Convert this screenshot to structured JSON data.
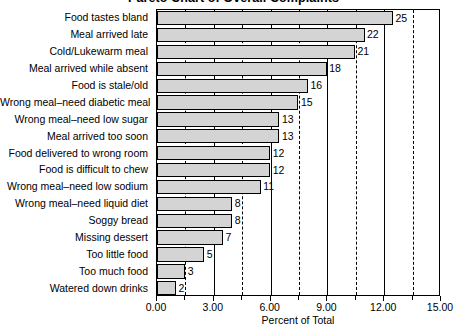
{
  "chart_data": {
    "type": "bar",
    "orientation": "horizontal",
    "title": "Pareto Chart of Overall Complaints",
    "xlabel": "Percent of Total",
    "ylabel": "",
    "xlim": [
      0.0,
      15.0
    ],
    "xticks": [
      "0.00",
      "3.00",
      "6.00",
      "9.00",
      "12.00",
      "15.00"
    ],
    "xtick_values": [
      0.0,
      3.0,
      6.0,
      9.0,
      12.0,
      15.0
    ],
    "minor_gridlines": [
      1.5,
      4.5,
      7.5,
      10.5,
      13.5
    ],
    "grid": true,
    "legend": "none",
    "bar_color": "#d4d4d4",
    "bar_edge_color": "#000000",
    "categories": [
      "Food tastes bland",
      "Meal arrived late",
      "Cold/Lukewarm meal",
      "Meal arrived while absent",
      "Food is stale/old",
      "Wrong meal–need diabetic meal",
      "Wrong meal–need low sugar",
      "Meal arrived too soon",
      "Food delivered to wrong room",
      "Food is difficult to chew",
      "Wrong meal–need low sodium",
      "Wrong meal–need liquid diet",
      "Soggy bread",
      "Missing dessert",
      "Too little food",
      "Too much food",
      "Watered down drinks"
    ],
    "values": [
      25,
      22,
      21,
      18,
      16,
      15,
      13,
      13,
      12,
      12,
      11,
      8,
      8,
      7,
      5,
      3,
      2
    ],
    "value_labels": [
      "25",
      "22",
      "21",
      "18",
      "16",
      "15",
      "13",
      "13",
      "12",
      "12",
      "11",
      "8",
      "8",
      "7",
      "5",
      "3",
      "2"
    ],
    "percent_of_total": [
      12.46,
      10.96,
      10.46,
      8.96,
      7.97,
      7.47,
      6.47,
      6.47,
      5.98,
      5.98,
      5.48,
      3.98,
      3.98,
      3.49,
      2.49,
      1.49,
      1.0
    ]
  }
}
